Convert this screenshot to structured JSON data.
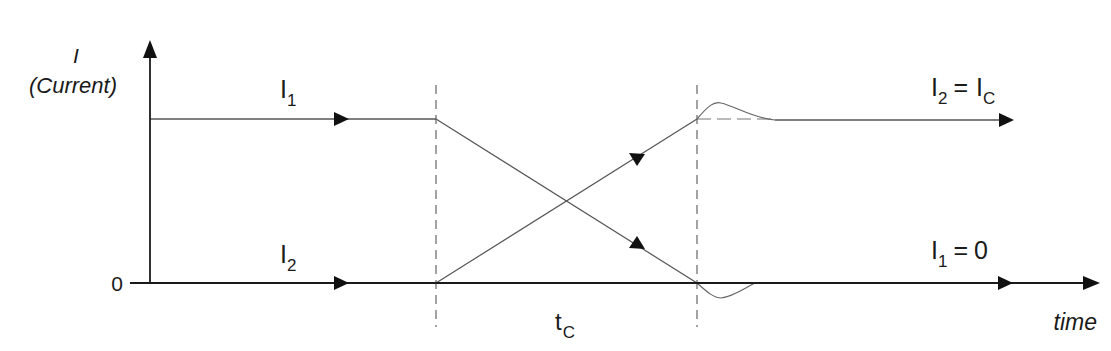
{
  "diagram": {
    "y_axis": {
      "symbol": "I",
      "label": "(Current)",
      "zero_label": "0"
    },
    "x_axis": {
      "label": "time"
    },
    "interval_label": {
      "main": "t",
      "sub": "C"
    },
    "curves": {
      "i1_initial": {
        "main": "I",
        "sub": "1"
      },
      "i2_initial": {
        "main": "I",
        "sub": "2"
      },
      "i2_final": {
        "main": "I",
        "sub": "2",
        "eq": "=",
        "rhs_main": "I",
        "rhs_sub": "C"
      },
      "i1_final": {
        "main": "I",
        "sub": "1",
        "eq": "=",
        "rhs": "0"
      }
    },
    "colors": {
      "axis": "#1a1a1a",
      "line": "#555555",
      "dash": "#666666",
      "background": "#ffffff"
    }
  }
}
